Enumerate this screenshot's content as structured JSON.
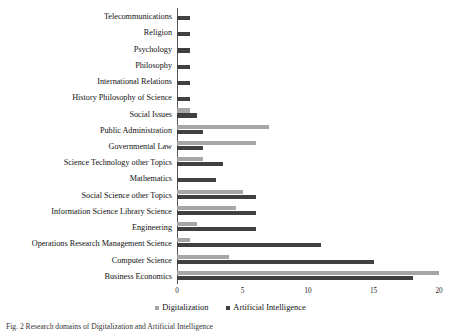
{
  "chart_data": {
    "type": "bar",
    "orientation": "horizontal",
    "title": "",
    "xlabel": "",
    "ylabel": "",
    "xlim": [
      0,
      20
    ],
    "xticks": [
      0,
      5,
      10,
      15,
      20
    ],
    "grid": false,
    "legend_position": "bottom",
    "categories": [
      "Telecommunications",
      "Religion",
      "Psychology",
      "Philosophy",
      "International Relations",
      "History Philosophy of Science",
      "Social Issues",
      "Public Administration",
      "Governmental Law",
      "Science Technology other Topics",
      "Mathematics",
      "Social Science other Topics",
      "Information Science Library Science",
      "Engineering",
      "Operations Research Management Science",
      "Computer Science",
      "Business Economics"
    ],
    "series": [
      {
        "name": "Digitalization",
        "color": "#a6a6a6",
        "values": [
          0,
          0,
          0,
          0,
          0,
          0,
          1,
          7,
          6,
          2,
          0,
          5,
          4.5,
          1.5,
          1,
          4,
          20
        ]
      },
      {
        "name": "Artificial Intelligence",
        "color": "#404040",
        "values": [
          1,
          1,
          1,
          1,
          1,
          1,
          1.5,
          2,
          2,
          3.5,
          3,
          6,
          6,
          6,
          11,
          15,
          18
        ]
      }
    ]
  },
  "legend": {
    "items": [
      {
        "label": "Digitalization",
        "color": "#a6a6a6"
      },
      {
        "label": "Artificial Intelligence",
        "color": "#404040"
      }
    ]
  },
  "caption": {
    "text": "Fig. 2  Research domains of Digitalization and Artificial Intelligence"
  }
}
